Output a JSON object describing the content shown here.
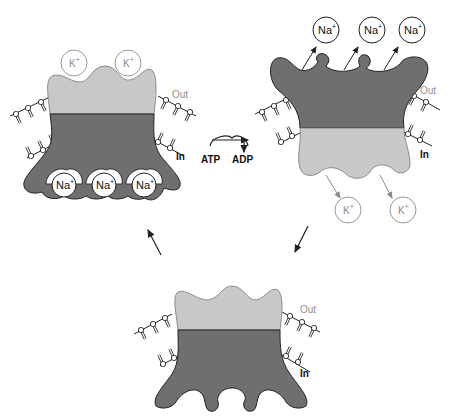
{
  "diagram": {
    "colors": {
      "dark_protein": "#6f6f6f",
      "light_protein": "#c8c8c8",
      "outline": "#222222",
      "light_ion_stroke": "#9a9a9a",
      "background": "#ffffff"
    },
    "states": [
      {
        "id": "state-1",
        "position": "top-left",
        "description": "Na+ bound on inside, K+ released outside",
        "out_label": "Out",
        "in_label": "In",
        "ions_outside": [
          "K+",
          "K+"
        ],
        "ions_inside": [
          "Na+",
          "Na+",
          "Na+"
        ]
      },
      {
        "id": "state-2",
        "position": "top-right",
        "description": "Phosphorylated pump releases Na+ outside, K+ enters",
        "out_label": "Out",
        "in_label": "In",
        "ions_outside": [
          "Na+",
          "Na+",
          "Na+"
        ],
        "ions_inside": [
          "K+",
          "K+"
        ]
      },
      {
        "id": "state-3",
        "position": "bottom-center",
        "description": "Empty pump returns to inward-facing state",
        "out_label": "Out",
        "in_label": "In",
        "ions_outside": [],
        "ions_inside": []
      }
    ],
    "reaction": {
      "substrate": "ATP",
      "product": "ADP"
    },
    "labels": {
      "k_ion": "K",
      "na_ion": "Na",
      "plus": "+",
      "out": "Out",
      "in": "In",
      "atp": "ATP",
      "adp": "ADP"
    }
  }
}
